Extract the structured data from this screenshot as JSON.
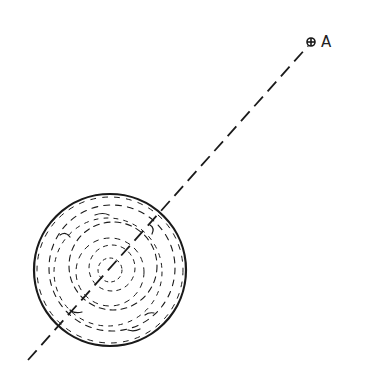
{
  "diagram": {
    "colors": {
      "ink": "#1a1a1a",
      "background": "#ffffff"
    },
    "sphere": {
      "cx": 110,
      "cy": 270,
      "r": 76
    },
    "axis_line": {
      "x1": 28,
      "y1": 360,
      "x2": 308,
      "y2": 46,
      "style": "dashed"
    },
    "point": {
      "label": "A",
      "x": 311,
      "y": 42
    }
  }
}
